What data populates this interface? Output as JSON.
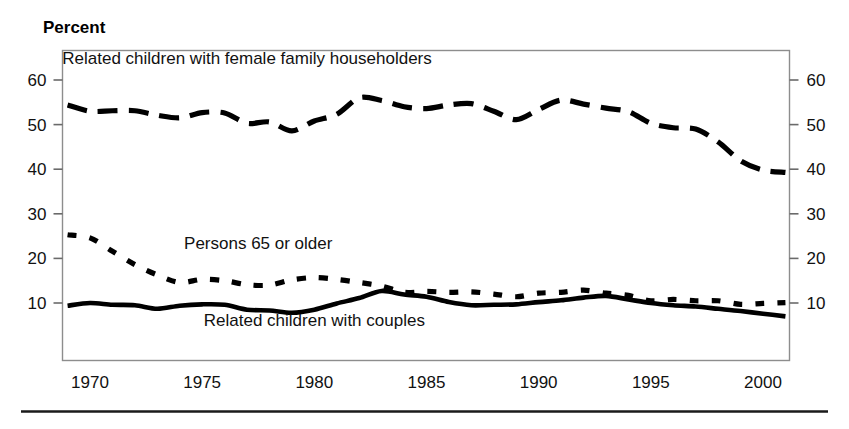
{
  "figure": {
    "y_axis_title": "Percent",
    "footer_rule": "horizontal-rule"
  },
  "chart_data": {
    "type": "line",
    "title": "",
    "subtitle": "",
    "xlabel": "",
    "ylabel": "Percent",
    "xlim": [
      1969,
      2001
    ],
    "ylim": [
      0,
      65
    ],
    "yticks": [
      10,
      20,
      30,
      40,
      50,
      60
    ],
    "ytick_labels_left": [
      "60",
      "50",
      "40",
      "30",
      "20",
      "10"
    ],
    "ytick_labels_right": [
      "60",
      "50",
      "40",
      "30",
      "20",
      "10"
    ],
    "xticks": [
      1970,
      1975,
      1980,
      1985,
      1990,
      1995,
      2000
    ],
    "xtick_labels": [
      "1970",
      "1975",
      "1980",
      "1985",
      "1990",
      "1995",
      "2000"
    ],
    "grid": false,
    "legend_position": "inline-annotations",
    "x": [
      1969,
      1970,
      1971,
      1972,
      1973,
      1974,
      1975,
      1976,
      1977,
      1978,
      1979,
      1980,
      1981,
      1982,
      1983,
      1984,
      1985,
      1986,
      1987,
      1988,
      1989,
      1990,
      1991,
      1992,
      1993,
      1994,
      1995,
      1996,
      1997,
      1998,
      1999,
      2000,
      2001
    ],
    "series": [
      {
        "name": "Related children with female family householders",
        "style": "long-dash",
        "label_x": 1977.0,
        "label_y": 63.5,
        "values": [
          54.4,
          53.0,
          53.1,
          53.1,
          52.1,
          51.5,
          52.7,
          52.6,
          50.3,
          50.6,
          48.6,
          50.8,
          52.3,
          56.0,
          55.4,
          54.0,
          53.6,
          54.4,
          54.7,
          53.0,
          51.1,
          53.4,
          55.5,
          54.6,
          53.7,
          52.9,
          50.3,
          49.3,
          49.0,
          46.1,
          41.9,
          39.8,
          39.3
        ],
        "stroke_width": 5.2,
        "dash": "20,11"
      },
      {
        "name": "Persons 65 or older",
        "style": "short-dash",
        "label_x": 1977.5,
        "label_y": 22.0,
        "values": [
          25.3,
          24.6,
          21.6,
          18.6,
          16.3,
          14.6,
          15.3,
          15.0,
          14.1,
          14.0,
          15.2,
          15.7,
          15.3,
          14.6,
          13.8,
          12.4,
          12.6,
          12.4,
          12.5,
          12.0,
          11.4,
          12.2,
          12.4,
          12.9,
          12.2,
          11.7,
          10.5,
          10.8,
          10.5,
          10.5,
          9.7,
          9.9,
          10.1
        ],
        "stroke_width": 5.2,
        "dash": "9,13"
      },
      {
        "name": "Related children with couples",
        "style": "solid",
        "label_x": 1980.0,
        "label_y": 4.8,
        "values": [
          9.4,
          10.0,
          9.6,
          9.5,
          8.7,
          9.4,
          9.7,
          9.6,
          8.5,
          8.3,
          7.8,
          8.5,
          9.9,
          11.1,
          12.7,
          11.9,
          11.4,
          10.2,
          9.5,
          9.6,
          9.7,
          10.2,
          10.6,
          11.2,
          11.6,
          10.8,
          10.0,
          9.5,
          9.2,
          8.7,
          8.2,
          7.6,
          7.0
        ],
        "stroke_width": 4.6,
        "dash": "none"
      }
    ]
  }
}
